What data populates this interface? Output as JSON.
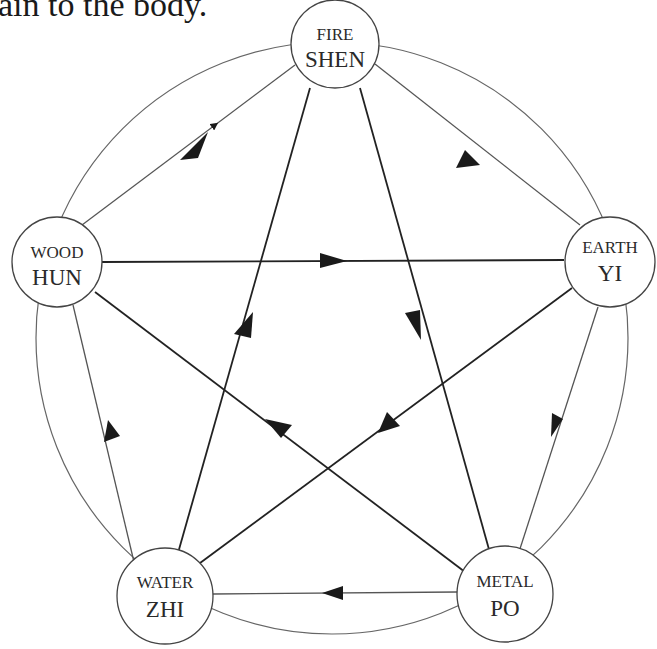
{
  "caption": "ain to the body.",
  "nodes": {
    "fire": {
      "element": "FIRE",
      "spirit": "SHEN"
    },
    "wood": {
      "element": "WOOD",
      "spirit": "HUN"
    },
    "earth": {
      "element": "EARTH",
      "spirit": "YI"
    },
    "water": {
      "element": "WATER",
      "spirit": "ZHI"
    },
    "metal": {
      "element": "METAL",
      "spirit": "PO"
    }
  },
  "generating_cycle": [
    {
      "from": "WOOD",
      "to": "FIRE"
    },
    {
      "from": "FIRE",
      "to": "EARTH"
    },
    {
      "from": "EARTH",
      "to": "METAL"
    },
    {
      "from": "METAL",
      "to": "WATER"
    },
    {
      "from": "WATER",
      "to": "WOOD"
    }
  ],
  "controlling_cycle": [
    {
      "from": "WOOD",
      "to": "EARTH"
    },
    {
      "from": "EARTH",
      "to": "WATER"
    },
    {
      "from": "WATER",
      "to": "FIRE"
    },
    {
      "from": "FIRE",
      "to": "METAL"
    },
    {
      "from": "METAL",
      "to": "WOOD"
    }
  ],
  "colors": {
    "line": "#555555",
    "arrow": "#1a1a1a",
    "text": "#2a2a2a",
    "background": "#ffffff"
  }
}
